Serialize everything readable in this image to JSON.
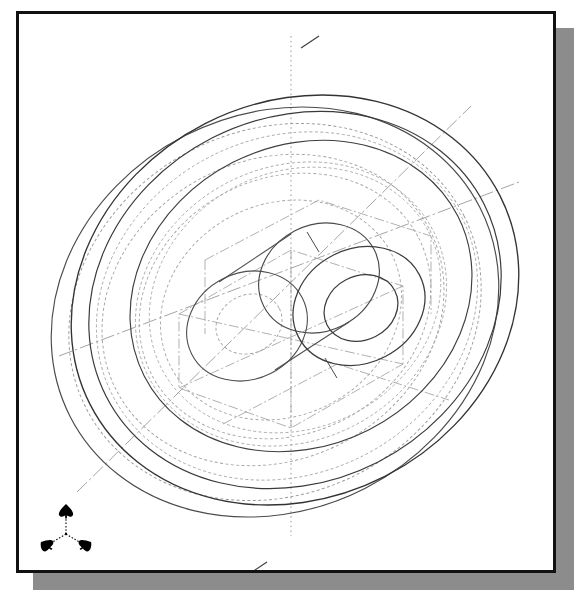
{
  "app": {
    "title": "CAD Isometric Wireframe Viewport",
    "view_label": "Isometric",
    "background_color": "#ffffff",
    "paper_color": "#ffffff",
    "border_color": "#111111",
    "shadow_color": "#8c8c8c",
    "line_color": "#3a3a3a",
    "hidden_line_color": "#8e8e8e",
    "center_line_color": "#9a9a9a"
  },
  "viewport": {
    "name": "model-viewport",
    "width": 534,
    "height": 556,
    "projection": "isometric"
  },
  "axis_tripod": {
    "name": "axis-tripod-icon",
    "arrows": [
      {
        "axis": "Z",
        "label": "",
        "direction": "up"
      },
      {
        "axis": "X",
        "label": "",
        "direction": "down-left"
      },
      {
        "axis": "Y",
        "label": "",
        "direction": "down-right"
      }
    ],
    "origin_x": 29,
    "origin_y": 36,
    "color": "#000000"
  },
  "model": {
    "name": "wheel-pulley-assembly",
    "description": "Isometric wireframe of a wheel / flywheel with central hub boss and through bore",
    "center": {
      "x": 292,
      "y": 293
    },
    "ellipse_ratio": 0.86,
    "rotation_deg": -28,
    "features": [
      {
        "name": "outer-rim-front-face",
        "type": "ellipse",
        "rx": 232,
        "ry": 200,
        "offset_x": 0,
        "offset_y": 0,
        "style": "solid"
      },
      {
        "name": "outer-rim-back-face",
        "type": "ellipse",
        "rx": 232,
        "ry": 200,
        "offset_x": -18,
        "offset_y": 12,
        "style": "solid"
      },
      {
        "name": "rim-groove-front",
        "type": "ellipse",
        "rx": 214,
        "ry": 184,
        "offset_x": 0,
        "offset_y": 0,
        "style": "solid"
      },
      {
        "name": "rim-groove-back",
        "type": "ellipse",
        "rx": 214,
        "ry": 184,
        "offset_x": -18,
        "offset_y": 12,
        "style": "hidden"
      },
      {
        "name": "rim-inner-face-front",
        "type": "ellipse",
        "rx": 176,
        "ry": 151,
        "offset_x": -4,
        "offset_y": 2,
        "style": "hidden"
      },
      {
        "name": "web-disc-outer",
        "type": "ellipse",
        "rx": 150,
        "ry": 129,
        "offset_x": -8,
        "offset_y": 5,
        "style": "hidden"
      },
      {
        "name": "web-disc-inner",
        "type": "ellipse",
        "rx": 122,
        "ry": 105,
        "offset_x": -10,
        "offset_y": 7,
        "style": "hidden"
      },
      {
        "name": "hub-back-face",
        "type": "ellipse",
        "rx": 62,
        "ry": 53,
        "offset_x": -42,
        "offset_y": 28,
        "style": "solid"
      },
      {
        "name": "hub-mid-face",
        "type": "ellipse",
        "rx": 62,
        "ry": 53,
        "offset_x": 10,
        "offset_y": -7,
        "style": "solid"
      },
      {
        "name": "hub-front-face",
        "type": "ellipse",
        "rx": 56,
        "ry": 48,
        "offset_x": 48,
        "offset_y": -32,
        "style": "solid"
      },
      {
        "name": "hub-bore-front",
        "type": "ellipse",
        "rx": 33,
        "ry": 28,
        "offset_x": 52,
        "offset_y": -34,
        "style": "solid"
      },
      {
        "name": "hub-bore-back",
        "type": "ellipse",
        "rx": 33,
        "ry": 28,
        "offset_x": -40,
        "offset_y": 26,
        "style": "hidden"
      }
    ],
    "center_lines": [
      {
        "name": "vertical-center-line",
        "style": "dotted"
      },
      {
        "name": "axis-of-revolution",
        "style": "dash-dot"
      },
      {
        "name": "iso-construction-line-a",
        "style": "dash-dot"
      },
      {
        "name": "iso-construction-line-b",
        "style": "dash-dot"
      }
    ]
  }
}
